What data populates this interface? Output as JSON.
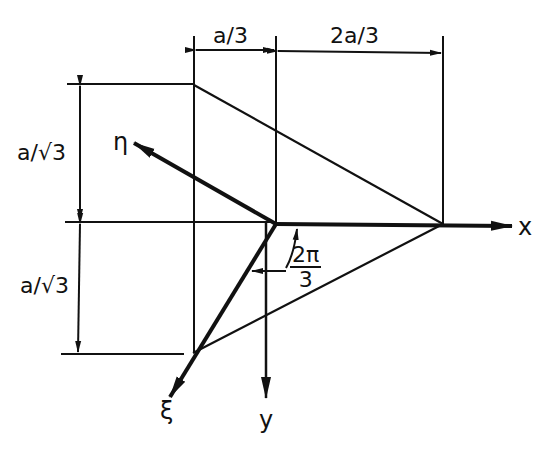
{
  "figure": {
    "type": "geometric construction"
  },
  "dimensions": {
    "top_left": "a/3",
    "top_right": "2a/3",
    "left_upper": "a/√3",
    "left_lower": "a/√3"
  },
  "axes": {
    "x": "x",
    "y": "y",
    "xi": "ξ",
    "eta": "η"
  },
  "angle": {
    "numerator": "2π",
    "denominator": "3"
  },
  "colors": {
    "line": "#111111",
    "background": "#ffffff"
  }
}
